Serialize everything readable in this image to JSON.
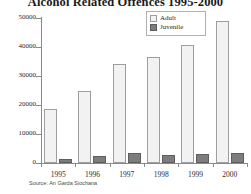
{
  "chart_data": {
    "type": "bar",
    "title": "Alcohol Related Offences 1995-2000",
    "xlabel": "",
    "ylabel": "",
    "categories": [
      "1995",
      "1996",
      "1997",
      "1998",
      "1999",
      "2000"
    ],
    "series": [
      {
        "name": "Adult",
        "values": [
          18600,
          24800,
          34100,
          36500,
          40700,
          49000
        ],
        "color": "#f2f2f2"
      },
      {
        "name": "Juvenile",
        "values": [
          1400,
          2300,
          3400,
          2900,
          3000,
          3400
        ],
        "color": "#7d7d7d"
      }
    ],
    "ylim": [
      0,
      50000
    ],
    "yticks": [
      0,
      10000,
      20000,
      30000,
      40000,
      50000
    ],
    "ytick_labels": [
      "0",
      "10000",
      "20000",
      "30000",
      "40000",
      "50000"
    ],
    "grid": false,
    "legend_position": "top-right",
    "source": "Source: An Garda Siochana"
  }
}
